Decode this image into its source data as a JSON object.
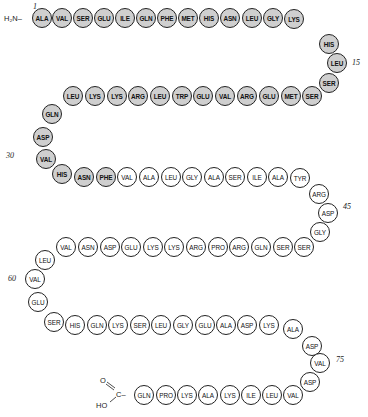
{
  "n_terminus": {
    "label": "H₂N–"
  },
  "c_terminus": {
    "o_label": "O",
    "c_label": "C–",
    "ho_label": "HO"
  },
  "shaded_color": "#cfcfcf",
  "number_labels": [
    {
      "text": "1",
      "x": 33,
      "y": 2
    },
    {
      "text": "15",
      "x": 352,
      "y": 58
    },
    {
      "text": "30",
      "x": 6,
      "y": 151
    },
    {
      "text": "45",
      "x": 343,
      "y": 202
    },
    {
      "text": "60",
      "x": 8,
      "y": 274
    },
    {
      "text": "75",
      "x": 336,
      "y": 355
    }
  ],
  "residues": [
    {
      "n": 1,
      "aa": "ALA",
      "x": 32,
      "y": 8,
      "shaded": true
    },
    {
      "n": 2,
      "aa": "VAL",
      "x": 52,
      "y": 8,
      "shaded": true
    },
    {
      "n": 3,
      "aa": "SER",
      "x": 73,
      "y": 8,
      "shaded": true
    },
    {
      "n": 4,
      "aa": "GLU",
      "x": 94,
      "y": 8,
      "shaded": true
    },
    {
      "n": 5,
      "aa": "ILE",
      "x": 115,
      "y": 8,
      "shaded": true
    },
    {
      "n": 6,
      "aa": "GLN",
      "x": 136,
      "y": 8,
      "shaded": true
    },
    {
      "n": 7,
      "aa": "PHE",
      "x": 157,
      "y": 8,
      "shaded": true
    },
    {
      "n": 8,
      "aa": "MET",
      "x": 178,
      "y": 8,
      "shaded": true
    },
    {
      "n": 9,
      "aa": "HIS",
      "x": 199,
      "y": 8,
      "shaded": true
    },
    {
      "n": 10,
      "aa": "ASN",
      "x": 220,
      "y": 8,
      "shaded": true
    },
    {
      "n": 11,
      "aa": "LEU",
      "x": 242,
      "y": 8,
      "shaded": true
    },
    {
      "n": 12,
      "aa": "GLY",
      "x": 263,
      "y": 8,
      "shaded": true
    },
    {
      "n": 13,
      "aa": "LYS",
      "x": 284,
      "y": 9,
      "shaded": true
    },
    {
      "n": 14,
      "aa": "HIS",
      "x": 319,
      "y": 34,
      "shaded": true
    },
    {
      "n": 15,
      "aa": "LEU",
      "x": 327,
      "y": 53,
      "shaded": true
    },
    {
      "n": 16,
      "aa": "SER",
      "x": 319,
      "y": 73,
      "shaded": true
    },
    {
      "n": 17,
      "aa": "SER",
      "x": 302,
      "y": 86,
      "shaded": true
    },
    {
      "n": 18,
      "aa": "MET",
      "x": 281,
      "y": 86,
      "shaded": true
    },
    {
      "n": 19,
      "aa": "GLU",
      "x": 259,
      "y": 86,
      "shaded": true
    },
    {
      "n": 20,
      "aa": "ARG",
      "x": 237,
      "y": 86,
      "shaded": true
    },
    {
      "n": 21,
      "aa": "VAL",
      "x": 215,
      "y": 86,
      "shaded": true
    },
    {
      "n": 22,
      "aa": "GLU",
      "x": 193,
      "y": 86,
      "shaded": true
    },
    {
      "n": 23,
      "aa": "TRP",
      "x": 172,
      "y": 86,
      "shaded": true
    },
    {
      "n": 24,
      "aa": "LEU",
      "x": 150,
      "y": 86,
      "shaded": true
    },
    {
      "n": 25,
      "aa": "ARG",
      "x": 128,
      "y": 86,
      "shaded": true
    },
    {
      "n": 26,
      "aa": "LYS",
      "x": 107,
      "y": 86,
      "shaded": true
    },
    {
      "n": 27,
      "aa": "LYS",
      "x": 85,
      "y": 86,
      "shaded": true
    },
    {
      "n": 28,
      "aa": "LEU",
      "x": 63,
      "y": 86,
      "shaded": true
    },
    {
      "n": 29,
      "aa": "GLN",
      "x": 42,
      "y": 104,
      "shaded": true
    },
    {
      "n": 30,
      "aa": "ASP",
      "x": 33,
      "y": 127,
      "shaded": true
    },
    {
      "n": 31,
      "aa": "VAL",
      "x": 36,
      "y": 149,
      "shaded": true
    },
    {
      "n": 32,
      "aa": "HIS",
      "x": 52,
      "y": 164,
      "shaded": true
    },
    {
      "n": 33,
      "aa": "ASN",
      "x": 74,
      "y": 167,
      "shaded": true
    },
    {
      "n": 34,
      "aa": "PHE",
      "x": 96,
      "y": 167,
      "shaded": true
    },
    {
      "n": 35,
      "aa": "VAL",
      "x": 117,
      "y": 167,
      "shaded": false
    },
    {
      "n": 36,
      "aa": "ALA",
      "x": 139,
      "y": 167,
      "shaded": false
    },
    {
      "n": 37,
      "aa": "LEU",
      "x": 161,
      "y": 167,
      "shaded": false
    },
    {
      "n": 38,
      "aa": "GLY",
      "x": 182,
      "y": 167,
      "shaded": false
    },
    {
      "n": 39,
      "aa": "ALA",
      "x": 204,
      "y": 167,
      "shaded": false
    },
    {
      "n": 40,
      "aa": "SER",
      "x": 225,
      "y": 167,
      "shaded": false
    },
    {
      "n": 41,
      "aa": "ILE",
      "x": 247,
      "y": 167,
      "shaded": false
    },
    {
      "n": 42,
      "aa": "ALA",
      "x": 268,
      "y": 167,
      "shaded": false
    },
    {
      "n": 43,
      "aa": "TYR",
      "x": 290,
      "y": 168,
      "shaded": false
    },
    {
      "n": 44,
      "aa": "ARG",
      "x": 309,
      "y": 184,
      "shaded": false
    },
    {
      "n": 45,
      "aa": "ASP",
      "x": 318,
      "y": 203,
      "shaded": false
    },
    {
      "n": 46,
      "aa": "GLY",
      "x": 310,
      "y": 222,
      "shaded": false
    },
    {
      "n": 47,
      "aa": "SER",
      "x": 294,
      "y": 237,
      "shaded": false
    },
    {
      "n": 48,
      "aa": "SER",
      "x": 273,
      "y": 237,
      "shaded": false
    },
    {
      "n": 49,
      "aa": "GLN",
      "x": 251,
      "y": 237,
      "shaded": false
    },
    {
      "n": 50,
      "aa": "ARG",
      "x": 229,
      "y": 237,
      "shaded": false
    },
    {
      "n": 51,
      "aa": "PRO",
      "x": 208,
      "y": 237,
      "shaded": false
    },
    {
      "n": 52,
      "aa": "ARG",
      "x": 186,
      "y": 237,
      "shaded": false
    },
    {
      "n": 53,
      "aa": "LYS",
      "x": 164,
      "y": 237,
      "shaded": false
    },
    {
      "n": 54,
      "aa": "LYS",
      "x": 143,
      "y": 237,
      "shaded": false
    },
    {
      "n": 55,
      "aa": "GLU",
      "x": 121,
      "y": 237,
      "shaded": false
    },
    {
      "n": 56,
      "aa": "ASP",
      "x": 100,
      "y": 237,
      "shaded": false
    },
    {
      "n": 57,
      "aa": "ASN",
      "x": 78,
      "y": 237,
      "shaded": false
    },
    {
      "n": 58,
      "aa": "VAL",
      "x": 56,
      "y": 237,
      "shaded": false
    },
    {
      "n": 59,
      "aa": "LEU",
      "x": 35,
      "y": 250,
      "shaded": false
    },
    {
      "n": 60,
      "aa": "VAL",
      "x": 25,
      "y": 269,
      "shaded": false
    },
    {
      "n": 61,
      "aa": "GLU",
      "x": 28,
      "y": 292,
      "shaded": false
    },
    {
      "n": 62,
      "aa": "SER",
      "x": 44,
      "y": 312,
      "shaded": false
    },
    {
      "n": 63,
      "aa": "HIS",
      "x": 65,
      "y": 315,
      "shaded": false
    },
    {
      "n": 64,
      "aa": "GLN",
      "x": 87,
      "y": 315,
      "shaded": false
    },
    {
      "n": 65,
      "aa": "LYS",
      "x": 108,
      "y": 315,
      "shaded": false
    },
    {
      "n": 66,
      "aa": "SER",
      "x": 130,
      "y": 315,
      "shaded": false
    },
    {
      "n": 67,
      "aa": "LEU",
      "x": 151,
      "y": 315,
      "shaded": false
    },
    {
      "n": 68,
      "aa": "GLY",
      "x": 173,
      "y": 315,
      "shaded": false
    },
    {
      "n": 69,
      "aa": "GLU",
      "x": 195,
      "y": 315,
      "shaded": false
    },
    {
      "n": 70,
      "aa": "ALA",
      "x": 216,
      "y": 315,
      "shaded": false
    },
    {
      "n": 71,
      "aa": "ASP",
      "x": 237,
      "y": 315,
      "shaded": false
    },
    {
      "n": 72,
      "aa": "LYS",
      "x": 259,
      "y": 315,
      "shaded": false
    },
    {
      "n": 73,
      "aa": "ALA",
      "x": 283,
      "y": 319,
      "shaded": false
    },
    {
      "n": 74,
      "aa": "ASP",
      "x": 302,
      "y": 336,
      "shaded": false
    },
    {
      "n": 75,
      "aa": "VAL",
      "x": 310,
      "y": 353,
      "shaded": false
    },
    {
      "n": 76,
      "aa": "ASP",
      "x": 300,
      "y": 372,
      "shaded": false
    },
    {
      "n": 77,
      "aa": "VAL",
      "x": 283,
      "y": 385,
      "shaded": false
    },
    {
      "n": 78,
      "aa": "LEU",
      "x": 262,
      "y": 385,
      "shaded": false
    },
    {
      "n": 79,
      "aa": "ILE",
      "x": 241,
      "y": 385,
      "shaded": false
    },
    {
      "n": 80,
      "aa": "LYS",
      "x": 220,
      "y": 385,
      "shaded": false
    },
    {
      "n": 81,
      "aa": "ALA",
      "x": 198,
      "y": 385,
      "shaded": false
    },
    {
      "n": 82,
      "aa": "LYS",
      "x": 177,
      "y": 385,
      "shaded": false
    },
    {
      "n": 83,
      "aa": "PRO",
      "x": 156,
      "y": 385,
      "shaded": false
    },
    {
      "n": 84,
      "aa": "GLN",
      "x": 134,
      "y": 385,
      "shaded": false
    }
  ]
}
